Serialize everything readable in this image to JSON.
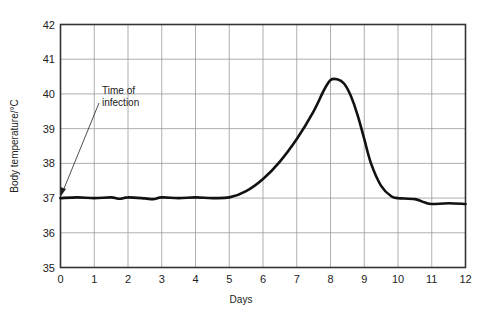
{
  "chart_data": {
    "type": "line",
    "title": "",
    "xlabel": "Days",
    "ylabel": "Body temperature/°C",
    "xlim": [
      0,
      12
    ],
    "ylim": [
      35,
      42
    ],
    "grid": true,
    "x_ticks": [
      "0",
      "1",
      "2",
      "3",
      "4",
      "5",
      "6",
      "7",
      "8",
      "9",
      "10",
      "11",
      "12"
    ],
    "y_ticks": [
      "35",
      "36",
      "37",
      "38",
      "39",
      "40",
      "41",
      "42"
    ],
    "annotation": {
      "text_line1": "Time of",
      "text_line2": "infection",
      "points_to": {
        "x": 0,
        "y": 37
      }
    },
    "series": [
      {
        "name": "Body temperature",
        "x": [
          0,
          0.5,
          1,
          1.5,
          1.75,
          2,
          2.5,
          2.75,
          3,
          3.5,
          4,
          4.5,
          5,
          5.5,
          6,
          6.5,
          7,
          7.5,
          7.8,
          8,
          8.2,
          8.4,
          8.6,
          8.8,
          9,
          9.2,
          9.5,
          9.8,
          10,
          10.5,
          10.8,
          11,
          11.5,
          12
        ],
        "values": [
          37.0,
          37.02,
          37.0,
          37.02,
          36.98,
          37.02,
          36.99,
          36.97,
          37.02,
          37.0,
          37.02,
          37.0,
          37.02,
          37.2,
          37.55,
          38.05,
          38.7,
          39.5,
          40.1,
          40.4,
          40.42,
          40.3,
          39.95,
          39.4,
          38.7,
          38.0,
          37.35,
          37.05,
          37.0,
          36.97,
          36.87,
          36.83,
          36.85,
          36.83
        ]
      }
    ],
    "line_color": "#111111"
  }
}
